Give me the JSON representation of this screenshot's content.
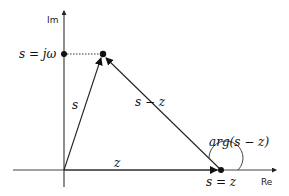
{
  "diagram": {
    "axes": {
      "real_label": "Re",
      "imag_label": "Im"
    },
    "labels": {
      "s_jw": "s = jω",
      "s_vec": "s",
      "s_minus_z_vec": "s − z",
      "z_vec": "z",
      "arg": "arg(s − z)",
      "s_eq_z": "s = z"
    },
    "colors": {
      "line": "#222222",
      "dot": "#111111"
    }
  }
}
